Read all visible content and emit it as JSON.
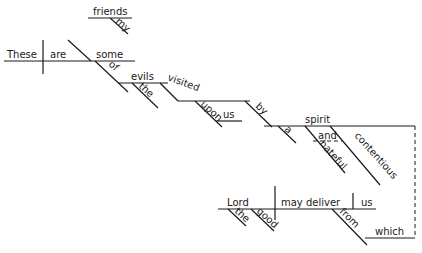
{
  "diagram": {
    "type": "Reed-Kellogg sentence diagram",
    "words": {
      "subject": "These",
      "verb": "are",
      "complement": "some",
      "friends": "friends",
      "my": "my",
      "of": "of",
      "evils": "evils",
      "the1": "the",
      "visited": "visited",
      "upon": "upon",
      "us1": "us",
      "by": "by",
      "a": "a",
      "spirit": "spirit",
      "and": "and",
      "hateful": "hateful",
      "contentious": "contentious",
      "lord": "Lord",
      "the2": "the",
      "good": "good",
      "may_deliver": "may deliver",
      "us2": "us",
      "from": "from",
      "which": "which"
    }
  }
}
